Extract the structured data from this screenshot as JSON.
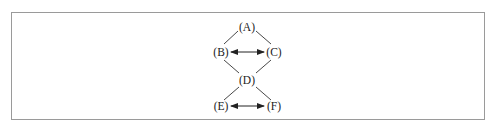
{
  "diagram": {
    "type": "lattice",
    "colors": {
      "line": "#333333",
      "text": "#222222",
      "border": "#9a9a9a"
    },
    "nodes": [
      {
        "id": "A",
        "label": "(A)",
        "x": 247,
        "y": 27
      },
      {
        "id": "B",
        "label": "(B)",
        "x": 221,
        "y": 52
      },
      {
        "id": "C",
        "label": "(C)",
        "x": 274,
        "y": 52
      },
      {
        "id": "D",
        "label": "(D)",
        "x": 247,
        "y": 80
      },
      {
        "id": "E",
        "label": "(E)",
        "x": 221,
        "y": 106
      },
      {
        "id": "F",
        "label": "(F)",
        "x": 274,
        "y": 106
      }
    ],
    "edges": [
      {
        "from": "B",
        "to": "A",
        "kind": "line"
      },
      {
        "from": "A",
        "to": "C",
        "kind": "line"
      },
      {
        "from": "B",
        "to": "D",
        "kind": "line"
      },
      {
        "from": "C",
        "to": "D",
        "kind": "line"
      },
      {
        "from": "D",
        "to": "E",
        "kind": "line"
      },
      {
        "from": "D",
        "to": "F",
        "kind": "line"
      },
      {
        "from": "B",
        "to": "C",
        "kind": "bidirectional-arrow"
      },
      {
        "from": "E",
        "to": "F",
        "kind": "bidirectional-arrow"
      }
    ]
  }
}
